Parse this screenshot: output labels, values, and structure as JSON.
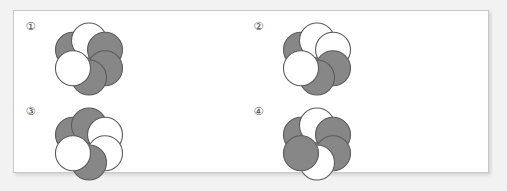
{
  "page": {
    "background_color": "#f2f2f2",
    "panel_background": "#ffffff",
    "panel_border_color": "#c9c9c9"
  },
  "style": {
    "gray_fill": "#878787",
    "white_fill": "#ffffff",
    "outline_color": "#5a5a5a",
    "circle_radius": 17.5,
    "ring_radius": 18.5
  },
  "figures": [
    {
      "id": "figure-1",
      "label": "①",
      "position": {
        "left": 22,
        "top": 18
      },
      "circles": [
        {
          "name": "circle-top-left",
          "angle": -150,
          "fill": "gray"
        },
        {
          "name": "circle-top-right",
          "angle": -90,
          "fill": "white"
        },
        {
          "name": "circle-right-upper",
          "angle": -30,
          "fill": "gray"
        },
        {
          "name": "circle-right-lower",
          "angle": 30,
          "fill": "gray"
        },
        {
          "name": "circle-bottom",
          "angle": 90,
          "fill": "gray"
        },
        {
          "name": "circle-left",
          "angle": 150,
          "fill": "white"
        }
      ]
    },
    {
      "id": "figure-2",
      "label": "②",
      "position": {
        "left": 250,
        "top": 18
      },
      "circles": [
        {
          "name": "circle-top-left",
          "angle": -150,
          "fill": "gray"
        },
        {
          "name": "circle-top-right",
          "angle": -90,
          "fill": "white"
        },
        {
          "name": "circle-right-upper",
          "angle": -30,
          "fill": "white"
        },
        {
          "name": "circle-right-lower",
          "angle": 30,
          "fill": "gray"
        },
        {
          "name": "circle-bottom",
          "angle": 90,
          "fill": "gray"
        },
        {
          "name": "circle-left",
          "angle": 150,
          "fill": "white"
        }
      ]
    },
    {
      "id": "figure-3",
      "label": "③",
      "position": {
        "left": 22,
        "top": 103
      },
      "circles": [
        {
          "name": "circle-top-left",
          "angle": -150,
          "fill": "gray"
        },
        {
          "name": "circle-top-right",
          "angle": -90,
          "fill": "gray"
        },
        {
          "name": "circle-right-upper",
          "angle": -30,
          "fill": "white"
        },
        {
          "name": "circle-right-lower",
          "angle": 30,
          "fill": "white"
        },
        {
          "name": "circle-bottom",
          "angle": 90,
          "fill": "gray"
        },
        {
          "name": "circle-left",
          "angle": 150,
          "fill": "white"
        }
      ]
    },
    {
      "id": "figure-4",
      "label": "④",
      "position": {
        "left": 250,
        "top": 103
      },
      "circles": [
        {
          "name": "circle-top-left",
          "angle": -150,
          "fill": "gray"
        },
        {
          "name": "circle-top-right",
          "angle": -90,
          "fill": "white"
        },
        {
          "name": "circle-right-upper",
          "angle": -30,
          "fill": "gray"
        },
        {
          "name": "circle-right-lower",
          "angle": 30,
          "fill": "gray"
        },
        {
          "name": "circle-bottom",
          "angle": 90,
          "fill": "white"
        },
        {
          "name": "circle-left",
          "angle": 150,
          "fill": "gray"
        }
      ]
    }
  ]
}
